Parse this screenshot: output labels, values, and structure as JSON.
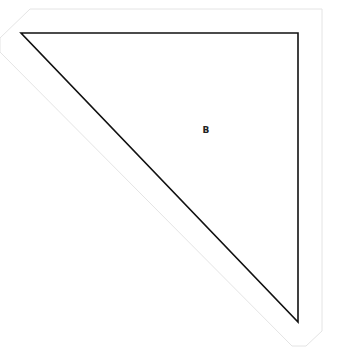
{
  "diagram": {
    "region_label": "B",
    "colors": {
      "shape_stroke": "#111111",
      "outline_stroke": "#e4e4e4",
      "background": "#ffffff"
    }
  }
}
